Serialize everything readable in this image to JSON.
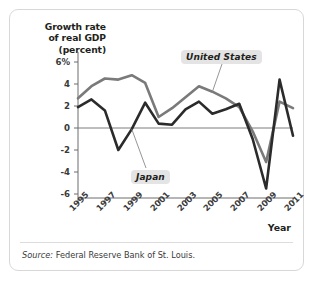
{
  "figure": {
    "y_axis_title_lines": [
      "Growth rate",
      "of real GDP",
      "(percent)"
    ],
    "x_axis_title": "Year",
    "source_prefix": "Source:",
    "source_text": "Federal Reserve Bank of St. Louis.",
    "series_tags": {
      "united_states": "United States",
      "japan": "Japan"
    },
    "colors": {
      "united_states_line": "#7a7a7a",
      "japan_line": "#2b2b2b",
      "axis": "#6d6d6d",
      "tag_background": "#e4e4e4",
      "card_border": "#d8d8d8",
      "text": "#231f20"
    }
  },
  "chart_data": {
    "type": "line",
    "title": "",
    "xlabel": "Year",
    "ylabel": "Growth rate of real GDP (percent)",
    "xlim": [
      1995,
      2011
    ],
    "ylim": [
      -6,
      6
    ],
    "ytick_labels": [
      "6%",
      "4",
      "2",
      "0",
      "-2",
      "-4",
      "-6"
    ],
    "ytick_values": [
      6,
      4,
      2,
      0,
      -2,
      -4,
      -6
    ],
    "xtick_labels": [
      "1995",
      "1997",
      "1999",
      "2001",
      "2003",
      "2005",
      "2007",
      "2009",
      "2011"
    ],
    "xtick_values": [
      1995,
      1997,
      1999,
      2001,
      2003,
      2005,
      2007,
      2009,
      2011
    ],
    "grid": false,
    "zero_line": true,
    "legend": "inline-annotations",
    "x": [
      1995,
      1996,
      1997,
      1998,
      1999,
      2000,
      2001,
      2002,
      2003,
      2004,
      2005,
      2006,
      2007,
      2008,
      2009,
      2010,
      2011
    ],
    "series": [
      {
        "name": "United States",
        "color": "#7a7a7a",
        "values": [
          2.7,
          3.8,
          4.5,
          4.4,
          4.8,
          4.1,
          1.0,
          1.8,
          2.8,
          3.8,
          3.3,
          2.7,
          1.9,
          -0.3,
          -3.1,
          2.4,
          1.8
        ]
      },
      {
        "name": "Japan",
        "color": "#2b2b2b",
        "values": [
          1.9,
          2.6,
          1.6,
          -2.0,
          -0.1,
          2.3,
          0.4,
          0.3,
          1.7,
          2.4,
          1.3,
          1.7,
          2.2,
          -1.0,
          -5.5,
          4.4,
          -0.7
        ]
      }
    ],
    "annotations": [
      {
        "text": "United States",
        "points_to_year": 2005,
        "points_to_value": 3.3
      },
      {
        "text": "Japan",
        "points_to_year": 1999,
        "points_to_value": -0.1
      }
    ]
  }
}
